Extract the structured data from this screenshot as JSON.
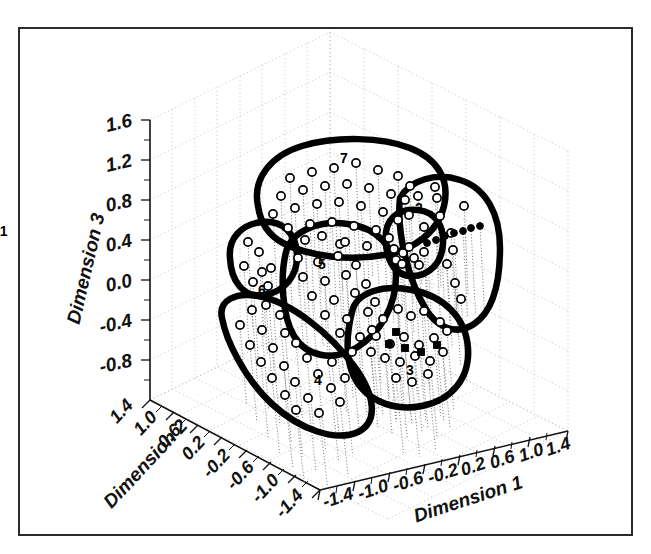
{
  "figure": {
    "background": "#ffffff",
    "frame_color": "#2b2b2b",
    "marker_open_color": "#ffffff",
    "marker_edge_color": "#000000",
    "hull_color": "#000000",
    "grid_color": "#9a9a9a"
  },
  "chart_data": {
    "type": "scatter",
    "projection": "3d",
    "title": "",
    "subtitle": "",
    "xlabel": "Dimension 1",
    "ylabel": "Dimension 2",
    "zlabel": "Dimension 3",
    "xticks": [
      "-1.4",
      "-1.0",
      "-0.6",
      "-0.2",
      "0.2",
      "0.6",
      "1.0",
      "1.4"
    ],
    "yticks": [
      "1.4",
      "1.0",
      "0.6",
      "0.2",
      "-0.2",
      "-0.6",
      "-1.0",
      "-1.4"
    ],
    "zticks": [
      "1.6",
      "1.2",
      "0.8",
      "0.4",
      "0.0",
      "-0.4",
      "-0.8"
    ],
    "xlim": [
      -1.6,
      1.6
    ],
    "ylim": [
      -1.6,
      1.6
    ],
    "zlim": [
      -1.0,
      1.8
    ],
    "grid": true,
    "legend": "none",
    "cluster_labels": [
      "1",
      "2",
      "3",
      "4",
      "5",
      "6",
      "7"
    ],
    "cluster_count": 7,
    "marker_styles": [
      "open-circle",
      "filled-square",
      "filled-dot"
    ],
    "annotations": [
      {
        "label": "1",
        "x": 3.55,
        "y": 236
      },
      {
        "label": "2",
        "x": 419,
        "y": 213
      },
      {
        "label": "3",
        "x": 410,
        "y": 375
      },
      {
        "label": "4",
        "x": 318,
        "y": 385
      },
      {
        "label": "5",
        "x": 322,
        "y": 269
      },
      {
        "label": "6",
        "x": 262,
        "y": 295
      },
      {
        "label": "7",
        "x": 344,
        "y": 163
      }
    ],
    "series": [
      {
        "name": "cluster-1",
        "marker": "open-circle",
        "points": [
          [
            403,
            253
          ],
          [
            409,
            247
          ],
          [
            396,
            260
          ],
          [
            414,
            258
          ],
          [
            402,
            264
          ],
          [
            419,
            265
          ],
          [
            394,
            249
          ],
          [
            424,
            252
          ]
        ]
      },
      {
        "name": "cluster-2",
        "marker": "open-circle",
        "points": [
          [
            418,
            196
          ],
          [
            437,
            198
          ],
          [
            409,
            215
          ],
          [
            440,
            216
          ],
          [
            424,
            227
          ],
          [
            451,
            233
          ],
          [
            453,
            250
          ],
          [
            447,
            264
          ],
          [
            455,
            283
          ],
          [
            461,
            299
          ],
          [
            435,
            187
          ],
          [
            464,
            206
          ]
        ]
      },
      {
        "name": "cluster-2-dots",
        "marker": "filled-dot",
        "points": [
          [
            427,
            243
          ],
          [
            436,
            240
          ],
          [
            445,
            236
          ],
          [
            454,
            233
          ],
          [
            463,
            231
          ],
          [
            471,
            228
          ],
          [
            480,
            226
          ]
        ]
      },
      {
        "name": "cluster-3",
        "marker": "open-circle",
        "points": [
          [
            383,
            319
          ],
          [
            398,
            309
          ],
          [
            411,
            316
          ],
          [
            424,
            311
          ],
          [
            440,
            322
          ],
          [
            376,
            336
          ],
          [
            390,
            344
          ],
          [
            404,
            337
          ],
          [
            419,
            345
          ],
          [
            434,
            338
          ],
          [
            385,
            358
          ],
          [
            400,
            362
          ],
          [
            415,
            356
          ],
          [
            430,
            361
          ],
          [
            396,
            378
          ],
          [
            412,
            382
          ],
          [
            428,
            374
          ],
          [
            443,
            352
          ],
          [
            371,
            352
          ],
          [
            447,
            331
          ]
        ]
      },
      {
        "name": "cluster-3-squares",
        "marker": "filled-square",
        "points": [
          [
            389,
            344
          ],
          [
            405,
            348
          ],
          [
            421,
            352
          ],
          [
            437,
            345
          ],
          [
            396,
            332
          ]
        ]
      },
      {
        "name": "cluster-4",
        "marker": "open-circle",
        "points": [
          [
            252,
            310
          ],
          [
            266,
            305
          ],
          [
            280,
            315
          ],
          [
            240,
            325
          ],
          [
            262,
            330
          ],
          [
            285,
            333
          ],
          [
            250,
            345
          ],
          [
            273,
            348
          ],
          [
            296,
            343
          ],
          [
            261,
            362
          ],
          [
            284,
            366
          ],
          [
            307,
            358
          ],
          [
            272,
            378
          ],
          [
            295,
            382
          ],
          [
            318,
            374
          ],
          [
            285,
            395
          ],
          [
            308,
            398
          ],
          [
            331,
            388
          ],
          [
            296,
            410
          ],
          [
            319,
            413
          ],
          [
            340,
            402
          ],
          [
            332,
            362
          ],
          [
            345,
            378
          ]
        ]
      },
      {
        "name": "cluster-5",
        "marker": "open-circle",
        "points": [
          [
            305,
            240
          ],
          [
            322,
            236
          ],
          [
            340,
            244
          ],
          [
            298,
            258
          ],
          [
            318,
            262
          ],
          [
            338,
            256
          ],
          [
            356,
            265
          ],
          [
            303,
            277
          ],
          [
            325,
            281
          ],
          [
            346,
            275
          ],
          [
            366,
            284
          ],
          [
            312,
            296
          ],
          [
            334,
            300
          ],
          [
            355,
            293
          ],
          [
            375,
            302
          ],
          [
            325,
            315
          ],
          [
            347,
            319
          ],
          [
            368,
            312
          ],
          [
            340,
            333
          ],
          [
            360,
            337
          ],
          [
            352,
            352
          ],
          [
            372,
            330
          ]
        ]
      },
      {
        "name": "cluster-6",
        "marker": "open-circle",
        "points": [
          [
            248,
            242
          ],
          [
            259,
            252
          ],
          [
            244,
            266
          ],
          [
            262,
            272
          ],
          [
            271,
            268
          ],
          [
            253,
            282
          ],
          [
            268,
            286
          ]
        ]
      },
      {
        "name": "cluster-7",
        "marker": "open-circle",
        "points": [
          [
            290,
            178
          ],
          [
            312,
            172
          ],
          [
            334,
            168
          ],
          [
            356,
            163
          ],
          [
            378,
            170
          ],
          [
            398,
            176
          ],
          [
            281,
            196
          ],
          [
            303,
            190
          ],
          [
            325,
            186
          ],
          [
            347,
            184
          ],
          [
            369,
            188
          ],
          [
            391,
            194
          ],
          [
            273,
            214
          ],
          [
            295,
            208
          ],
          [
            317,
            204
          ],
          [
            339,
            202
          ],
          [
            361,
            206
          ],
          [
            383,
            212
          ],
          [
            405,
            200
          ],
          [
            288,
            228
          ],
          [
            310,
            224
          ],
          [
            332,
            222
          ],
          [
            354,
            226
          ],
          [
            376,
            230
          ],
          [
            398,
            220
          ],
          [
            345,
            242
          ],
          [
            367,
            246
          ],
          [
            389,
            238
          ],
          [
            410,
            186
          ]
        ]
      }
    ]
  },
  "axes": {
    "z_title": "Dimension 3",
    "y_title": "Dimension 2",
    "x_title": "Dimension 1",
    "z_ticks": [
      "1.6",
      "1.2",
      "0.8",
      "0.4",
      "0.0",
      "-0.4",
      "-0.8"
    ],
    "y_ticks": [
      "1.4",
      "1.0",
      "0.6",
      "0.2",
      "-0.2",
      "-0.6",
      "-1.0",
      "-1.4"
    ],
    "x_ticks": [
      "-1.4",
      "-1.0",
      "-0.6",
      "-0.2",
      "0.2",
      "0.6",
      "1.0",
      "1.4"
    ]
  },
  "clusters": [
    {
      "id": "1",
      "label": "1"
    },
    {
      "id": "2",
      "label": "2"
    },
    {
      "id": "3",
      "label": "3"
    },
    {
      "id": "4",
      "label": "4"
    },
    {
      "id": "5",
      "label": "5"
    },
    {
      "id": "6",
      "label": "6"
    },
    {
      "id": "7",
      "label": "7"
    }
  ]
}
